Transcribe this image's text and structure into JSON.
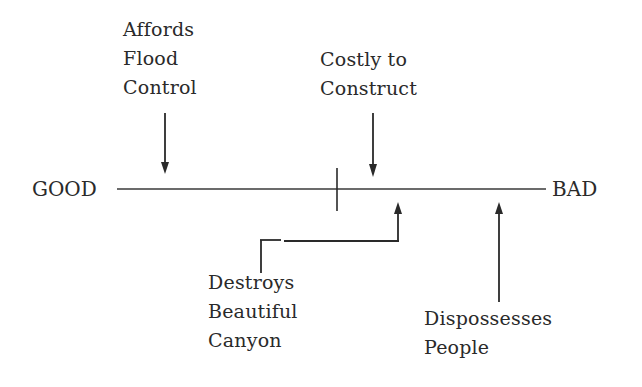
{
  "diagram": {
    "type": "evaluation-scale",
    "scale": {
      "left_label": "GOOD",
      "right_label": "BAD",
      "midpoint_tick": true
    },
    "factors": [
      {
        "id": "flood",
        "lines": [
          "Affords",
          "Flood",
          "Control"
        ],
        "position": "above",
        "arrow": "down",
        "side": "good"
      },
      {
        "id": "costly",
        "lines": [
          "Costly to",
          "Construct"
        ],
        "position": "above",
        "arrow": "down",
        "side": "bad"
      },
      {
        "id": "canyon",
        "lines": [
          "Destroys",
          "Beautiful",
          "Canyon"
        ],
        "position": "below",
        "arrow": "up",
        "side": "bad"
      },
      {
        "id": "people",
        "lines": [
          "Dispossesses",
          "People"
        ],
        "position": "below",
        "arrow": "up",
        "side": "bad"
      }
    ],
    "colors": {
      "ink": "#2a2a2a",
      "background": "#ffffff"
    }
  }
}
